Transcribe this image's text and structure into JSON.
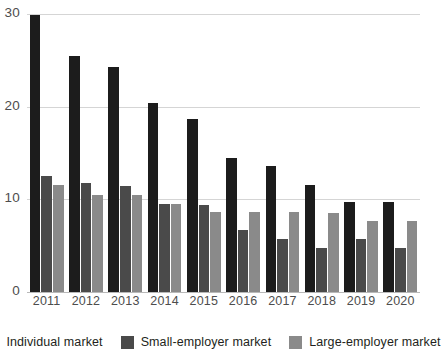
{
  "chart_data": {
    "type": "bar",
    "title": "",
    "subtitle": "",
    "xlabel": "",
    "ylabel": "",
    "ylim": [
      0,
      30
    ],
    "yticks": [
      0,
      10,
      20,
      30
    ],
    "ytick_labels": [
      "0",
      "10",
      "20",
      "30"
    ],
    "grid": true,
    "legend_position": "bottom",
    "categories": [
      "2011",
      "2012",
      "2013",
      "2014",
      "2015",
      "2016",
      "2017",
      "2018",
      "2019",
      "2020"
    ],
    "series": [
      {
        "name": "Individual market",
        "color": "#1c1c1c",
        "values": [
          29.9,
          25.5,
          24.3,
          20.4,
          18.7,
          14.5,
          13.6,
          11.5,
          9.7,
          9.7
        ]
      },
      {
        "name": "Small-employer market",
        "color": "#4a4a4a",
        "values": [
          12.5,
          11.8,
          11.4,
          9.5,
          9.4,
          6.7,
          5.7,
          4.7,
          5.7,
          4.8
        ]
      },
      {
        "name": "Large-employer market",
        "color": "#8a8a8a",
        "values": [
          11.5,
          10.5,
          10.5,
          9.5,
          8.6,
          8.6,
          8.6,
          8.5,
          7.7,
          7.7
        ]
      }
    ]
  },
  "legend": {
    "items": [
      {
        "label": "Individual market",
        "color": "#1c1c1c"
      },
      {
        "label": "Small-employer market",
        "color": "#4a4a4a"
      },
      {
        "label": "Large-employer market",
        "color": "#8a8a8a"
      }
    ]
  },
  "axes": {
    "y_tick_labels": [
      "0",
      "10",
      "20",
      "30"
    ],
    "x_tick_labels": [
      "2011",
      "2012",
      "2013",
      "2014",
      "2015",
      "2016",
      "2017",
      "2018",
      "2019",
      "2020"
    ]
  }
}
